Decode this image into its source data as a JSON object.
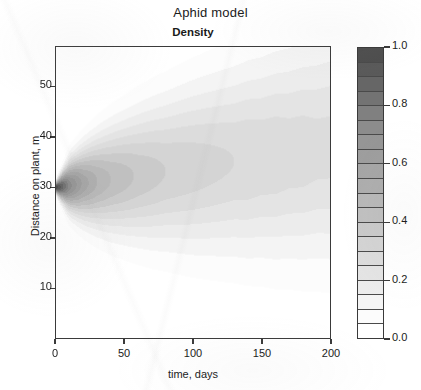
{
  "title": "Aphid model",
  "subtitle": "Density",
  "axes": {
    "xlabel": "time, days",
    "ylabel": "Distance on plant, m",
    "xticks": [
      "0",
      "50",
      "100",
      "150",
      "200"
    ],
    "yticks": [
      "10",
      "20",
      "30",
      "40",
      "50"
    ]
  },
  "colorbar": {
    "ticks": [
      "0.0",
      "0.2",
      "0.4",
      "0.6",
      "0.8",
      "1.0"
    ],
    "band_colors": [
      "#ffffff",
      "#fcfcfc",
      "#f4f4f4",
      "#ececec",
      "#e4e4e4",
      "#dcdcdc",
      "#d4d4d4",
      "#cacaca",
      "#c0c0c0",
      "#b8b8b8",
      "#aeaeae",
      "#a6a6a6",
      "#9e9e9e",
      "#969696",
      "#8c8c8c",
      "#808080",
      "#737373",
      "#666666",
      "#5a5a5a",
      "#4e4e4e"
    ]
  },
  "chart_data": {
    "type": "heatmap",
    "title": "Aphid model",
    "subtitle": "Density",
    "xlabel": "time, days",
    "ylabel": "Distance on plant, m",
    "xlim": [
      0,
      200
    ],
    "ylim": [
      0,
      58
    ],
    "xticks": [
      0,
      50,
      100,
      150,
      200
    ],
    "yticks": [
      10,
      20,
      30,
      40,
      50
    ],
    "zlim": [
      0.0,
      1.0
    ],
    "colorbar_ticks": [
      0.0,
      0.2,
      0.4,
      0.6,
      0.8,
      1.0
    ],
    "colormap": "grayscale-inverted-discrete",
    "n_levels": 20,
    "level_step": 0.05,
    "grid": false,
    "legend_position": "right",
    "source_point": {
      "time": 0,
      "distance": 30,
      "density": 1.0
    },
    "x": [
      0,
      10,
      20,
      30,
      40,
      50,
      60,
      70,
      80,
      90,
      100,
      110,
      120,
      130,
      140,
      150,
      160,
      170,
      180,
      190,
      200
    ],
    "y": [
      0,
      4,
      8,
      12,
      16,
      20,
      24,
      28,
      30,
      32,
      36,
      40,
      44,
      48,
      52,
      56,
      58
    ],
    "peak_density_by_time": [
      1.0,
      0.72,
      0.58,
      0.5,
      0.45,
      0.42,
      0.39,
      0.37,
      0.35,
      0.34,
      0.33,
      0.32,
      0.31,
      0.3,
      0.3,
      0.29,
      0.29,
      0.28,
      0.28,
      0.27,
      0.27
    ],
    "plume_halfwidth_m_by_time": [
      0.8,
      3.5,
      5.0,
      6.2,
      7.2,
      8.0,
      8.8,
      9.5,
      10.1,
      10.7,
      11.3,
      11.8,
      12.3,
      12.8,
      13.3,
      13.7,
      14.2,
      14.6,
      15.0,
      15.4,
      15.8
    ],
    "plume_center_m_by_time": [
      30.0,
      30.4,
      30.8,
      31.2,
      31.6,
      32.0,
      32.4,
      32.8,
      33.2,
      33.6,
      34.0,
      34.4,
      34.8,
      35.2,
      35.6,
      36.0,
      36.4,
      36.8,
      37.2,
      37.6,
      38.0
    ]
  }
}
